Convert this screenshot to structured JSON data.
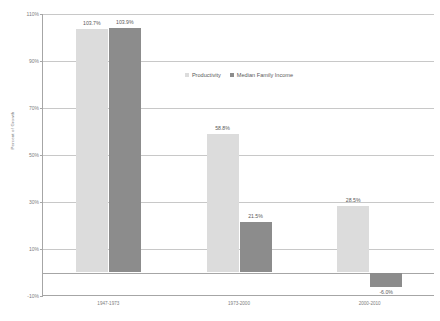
{
  "chart_data": {
    "type": "bar",
    "title": "",
    "xlabel": "",
    "ylabel": "Percent of Growth",
    "categories": [
      "1947-1973",
      "1973-2000",
      "2000-2010"
    ],
    "series": [
      {
        "name": "Productivity",
        "color": "#dcdcdc",
        "values": [
          103.7,
          58.8,
          28.5
        ],
        "labels": [
          "103.7%",
          "58.8%",
          "28.5%"
        ]
      },
      {
        "name": "Median Family Income",
        "color": "#8c8c8c",
        "values": [
          103.9,
          21.5,
          -6.0
        ],
        "labels": [
          "103.9%",
          "21.5%",
          "-6.0%"
        ]
      }
    ],
    "ylim": [
      -10,
      110
    ],
    "ytick_values": [
      110,
      90,
      70,
      50,
      30,
      10,
      -10
    ],
    "ytick_labels": [
      "110%",
      "90%",
      "70%",
      "50%",
      "30%",
      "10%",
      "-10%"
    ],
    "grid": true,
    "legend_position": "top-center",
    "axis_color": "#a6a6a6",
    "grid_color": "#c8c8c8",
    "text_color": "#7d7d7d"
  }
}
